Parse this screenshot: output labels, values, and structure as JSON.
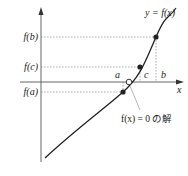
{
  "diagram": {
    "curve_label": "y = f(x)",
    "axis": {
      "x_label": "x"
    },
    "y_ticks": [
      {
        "label": "f(b)",
        "y": 37
      },
      {
        "label": "f(c)",
        "y": 67
      },
      {
        "label": "f(a)",
        "y": 92
      }
    ],
    "x_ticks": [
      {
        "label": "a",
        "x": 123
      },
      {
        "label": "c",
        "x": 140
      },
      {
        "label": "b",
        "x": 156
      }
    ],
    "points": [
      {
        "name": "point-a",
        "x": 123,
        "y": 92,
        "filled": true
      },
      {
        "name": "point-c",
        "x": 140,
        "y": 67,
        "filled": true
      },
      {
        "name": "point-b",
        "x": 156,
        "y": 37,
        "filled": true
      },
      {
        "name": "root",
        "x": 129,
        "y": 82,
        "filled": false
      }
    ],
    "annotation": "f(x) = 0 の解",
    "colors": {
      "line": "#222222",
      "axis": "#555555",
      "dashed": "#777777",
      "pointer": "#888888"
    }
  }
}
